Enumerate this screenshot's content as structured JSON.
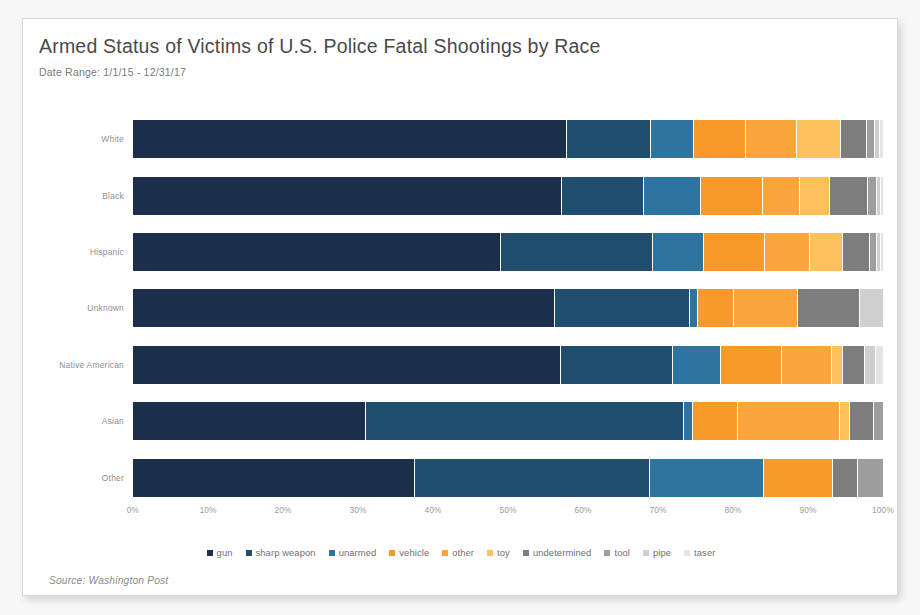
{
  "header": {
    "title": "Armed Status of Victims of U.S. Police Fatal Shootings by Race",
    "subtitle": "Date Range: 1/1/15 - 12/31/17"
  },
  "footer": {
    "source": "Source: Washington Post"
  },
  "chart_data": {
    "type": "bar",
    "orientation": "horizontal",
    "stacked": true,
    "normalized": "100%",
    "title": "Armed Status of Victims of U.S. Police Fatal Shootings by Race",
    "subtitle": "Date Range: 1/1/15 - 12/31/17",
    "xlabel": "",
    "ylabel": "",
    "xlim": [
      0,
      100
    ],
    "xtick_labels": [
      "0%",
      "10%",
      "20%",
      "30%",
      "40%",
      "50%",
      "60%",
      "70%",
      "80%",
      "90%",
      "100%"
    ],
    "xtick_values": [
      0,
      10,
      20,
      30,
      40,
      50,
      60,
      70,
      80,
      90,
      100
    ],
    "grid": false,
    "legend_position": "bottom",
    "categories": [
      "White",
      "Black",
      "Hispanic",
      "Unknown",
      "Native American",
      "Asian",
      "Other"
    ],
    "series": [
      {
        "name": "gun",
        "color": "#1b2f4d",
        "values": [
          57.8,
          57.2,
          49.1,
          56.2,
          57.0,
          31.0,
          37.6
        ]
      },
      {
        "name": "sharp weapon",
        "color": "#1f4e6e",
        "values": [
          11.2,
          10.9,
          20.2,
          18.0,
          15.0,
          42.4,
          31.4
        ]
      },
      {
        "name": "unarmed",
        "color": "#2d74a0",
        "values": [
          5.8,
          7.7,
          6.8,
          1.1,
          6.4,
          1.2,
          15.2
        ]
      },
      {
        "name": "vehicle",
        "color": "#f79a2a",
        "values": [
          6.9,
          8.2,
          8.1,
          4.8,
          8.1,
          6.1,
          9.2
        ]
      },
      {
        "name": "other",
        "color": "#fba63c",
        "values": [
          6.8,
          4.9,
          6.1,
          8.5,
          6.7,
          13.6,
          0.0
        ]
      },
      {
        "name": "toy",
        "color": "#fcc05c",
        "values": [
          5.9,
          4.0,
          4.4,
          0.0,
          1.5,
          1.3,
          0.0
        ]
      },
      {
        "name": "undetermined",
        "color": "#7d7d7d",
        "values": [
          3.4,
          5.1,
          3.5,
          8.3,
          2.9,
          3.2,
          3.3
        ]
      },
      {
        "name": "tool",
        "color": "#9e9e9e",
        "values": [
          1.1,
          1.2,
          1.0,
          0.0,
          0.0,
          1.2,
          3.3
        ]
      },
      {
        "name": "pipe",
        "color": "#cfcfcf",
        "values": [
          0.7,
          0.5,
          0.5,
          3.1,
          1.5,
          0.0,
          0.0
        ]
      },
      {
        "name": "taser",
        "color": "#e4e4e4",
        "values": [
          0.4,
          0.3,
          0.3,
          0.0,
          0.9,
          0.0,
          0.0
        ]
      }
    ]
  }
}
